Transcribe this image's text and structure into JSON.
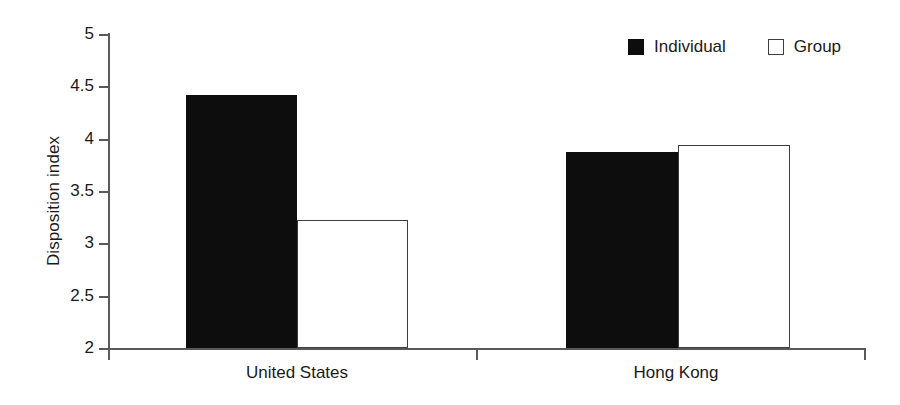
{
  "chart_data": {
    "type": "bar",
    "title": "",
    "xlabel": "",
    "ylabel": "Disposition index",
    "categories": [
      "United States",
      "Hong Kong"
    ],
    "series": [
      {
        "name": "Individual",
        "values": [
          4.42,
          3.87
        ],
        "color": "#0d0d0d",
        "style": "filled"
      },
      {
        "name": "Group",
        "values": [
          3.22,
          3.94
        ],
        "color": "#ffffff",
        "style": "hollow"
      }
    ],
    "ylim": [
      2,
      5
    ],
    "ytick_labels": [
      "5",
      "4.5",
      "4",
      "3.5",
      "3",
      "2.5",
      "2"
    ],
    "ytick_values": [
      5,
      4.5,
      4,
      3.5,
      3,
      2.5,
      2
    ],
    "grid": false,
    "legend_position": "top-right",
    "legend_entries": [
      "Individual",
      "Group"
    ]
  },
  "axes": {
    "y_title": "Disposition index",
    "y_ticks": [
      {
        "label": "5",
        "value": 5
      },
      {
        "label": "4.5",
        "value": 4.5
      },
      {
        "label": "4",
        "value": 4
      },
      {
        "label": "3.5",
        "value": 3.5
      },
      {
        "label": "3",
        "value": 3
      },
      {
        "label": "2.5",
        "value": 2.5
      },
      {
        "label": "2",
        "value": 2
      }
    ]
  },
  "categories": [
    {
      "label": "United States"
    },
    {
      "label": "Hong Kong"
    }
  ],
  "legend": {
    "items": [
      {
        "label": "Individual",
        "style": "filled"
      },
      {
        "label": "Group",
        "style": "hollow"
      }
    ]
  }
}
